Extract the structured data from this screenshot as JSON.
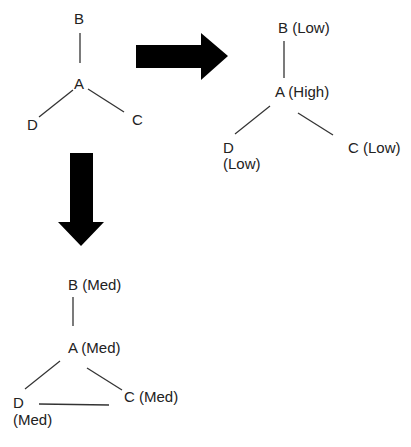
{
  "graphs": {
    "initial": {
      "nodes": {
        "B": "B",
        "A": "A",
        "D": "D",
        "C": "C"
      },
      "edges": [
        [
          "A",
          "B"
        ],
        [
          "A",
          "D"
        ],
        [
          "A",
          "C"
        ]
      ]
    },
    "right": {
      "nodes": {
        "B": "B (Low)",
        "A": "A (High)",
        "D": "D",
        "D_level": "(Low)",
        "C": "C (Low)"
      },
      "edges": [
        [
          "A",
          "B"
        ],
        [
          "A",
          "D"
        ],
        [
          "A",
          "C"
        ]
      ]
    },
    "bottom": {
      "nodes": {
        "B": "B (Med)",
        "A": "A (Med)",
        "D": "D",
        "D_level": "(Med)",
        "C": "C (Med)"
      },
      "edges": [
        [
          "A",
          "B"
        ],
        [
          "A",
          "D"
        ],
        [
          "A",
          "C"
        ],
        [
          "D",
          "C"
        ]
      ]
    }
  },
  "arrows": {
    "right": {
      "direction": "right",
      "color": "#000000"
    },
    "down": {
      "direction": "down",
      "color": "#000000"
    }
  }
}
